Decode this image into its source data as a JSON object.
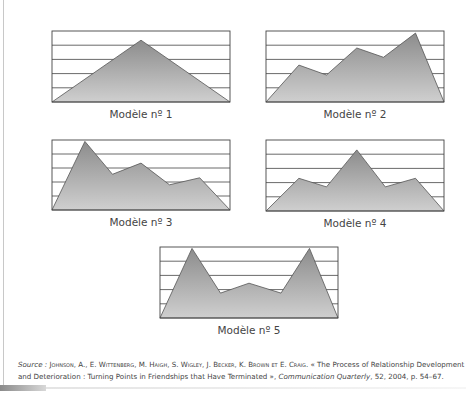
{
  "figure": {
    "panels": [
      {
        "label": "Modèle nº 1",
        "box": {
          "x": 52,
          "y": 31,
          "w": 178,
          "h": 71
        },
        "points": [
          [
            0,
            0
          ],
          [
            0.5,
            0.87
          ],
          [
            1,
            0
          ]
        ]
      },
      {
        "label": "Modèle nº 2",
        "box": {
          "x": 266,
          "y": 31,
          "w": 178,
          "h": 71
        },
        "points": [
          [
            0,
            0
          ],
          [
            0.185,
            0.52
          ],
          [
            0.34,
            0.38
          ],
          [
            0.51,
            0.76
          ],
          [
            0.66,
            0.63
          ],
          [
            0.84,
            0.97
          ],
          [
            1,
            0
          ]
        ]
      },
      {
        "label": "Modèle nº 3",
        "box": {
          "x": 52,
          "y": 140,
          "w": 178,
          "h": 70
        },
        "points": [
          [
            0,
            0
          ],
          [
            0.185,
            0.98
          ],
          [
            0.34,
            0.51
          ],
          [
            0.5,
            0.67
          ],
          [
            0.66,
            0.36
          ],
          [
            0.83,
            0.46
          ],
          [
            1,
            0
          ]
        ]
      },
      {
        "label": "Modèle nº 4",
        "box": {
          "x": 266,
          "y": 140,
          "w": 178,
          "h": 71
        },
        "points": [
          [
            0,
            0
          ],
          [
            0.185,
            0.46
          ],
          [
            0.34,
            0.34
          ],
          [
            0.51,
            0.86
          ],
          [
            0.67,
            0.34
          ],
          [
            0.84,
            0.46
          ],
          [
            1,
            0
          ]
        ]
      },
      {
        "label": "Modèle nº 5",
        "box": {
          "x": 160,
          "y": 247,
          "w": 178,
          "h": 71
        },
        "points": [
          [
            0,
            0
          ],
          [
            0.18,
            0.98
          ],
          [
            0.34,
            0.35
          ],
          [
            0.5,
            0.49
          ],
          [
            0.68,
            0.35
          ],
          [
            0.84,
            0.98
          ],
          [
            1,
            0
          ]
        ]
      }
    ],
    "gridlines": 5,
    "colors": {
      "fill_top": "#8c8c8c",
      "fill_bottom": "#c9c9c9",
      "stroke": "#555555",
      "grid": "#444444"
    }
  },
  "source": {
    "prefix": "Source : ",
    "authors": "Johnson, A., E. Wittenberg, M. Haigh, S. Wigley, J. Becker, K. Brown et E. Craig.",
    "title_open": " « The Process of Relationship Development",
    "title_line2": "and Deterioration : Turning Points in Friendships that Have Terminated »,",
    "journal": "Communication Quarterly",
    "details": ", 52, 2004, p. 54–67."
  },
  "chart_data": [
    {
      "type": "area",
      "title": "Modèle nº 1",
      "x": [
        0,
        1,
        2
      ],
      "values": [
        0,
        87,
        0
      ],
      "ylim": [
        0,
        100
      ],
      "grid": true,
      "xlabel": "",
      "ylabel": ""
    },
    {
      "type": "area",
      "title": "Modèle nº 2",
      "x": [
        0,
        1,
        2,
        3,
        4,
        5,
        6
      ],
      "values": [
        0,
        52,
        38,
        76,
        63,
        97,
        0
      ],
      "ylim": [
        0,
        100
      ],
      "grid": true,
      "xlabel": "",
      "ylabel": ""
    },
    {
      "type": "area",
      "title": "Modèle nº 3",
      "x": [
        0,
        1,
        2,
        3,
        4,
        5,
        6
      ],
      "values": [
        0,
        98,
        51,
        67,
        36,
        46,
        0
      ],
      "ylim": [
        0,
        100
      ],
      "grid": true,
      "xlabel": "",
      "ylabel": ""
    },
    {
      "type": "area",
      "title": "Modèle nº 4",
      "x": [
        0,
        1,
        2,
        3,
        4,
        5,
        6
      ],
      "values": [
        0,
        46,
        34,
        86,
        34,
        46,
        0
      ],
      "ylim": [
        0,
        100
      ],
      "grid": true,
      "xlabel": "",
      "ylabel": ""
    },
    {
      "type": "area",
      "title": "Modèle nº 5",
      "x": [
        0,
        1,
        2,
        3,
        4,
        5,
        6
      ],
      "values": [
        0,
        98,
        35,
        49,
        35,
        98,
        0
      ],
      "ylim": [
        0,
        100
      ],
      "grid": true,
      "xlabel": "",
      "ylabel": ""
    }
  ]
}
